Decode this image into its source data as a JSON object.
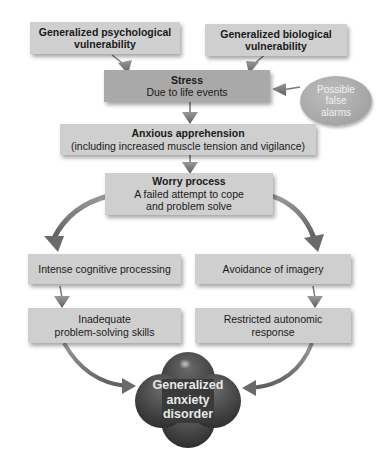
{
  "diagram": {
    "colors": {
      "box": "#cfcfcf",
      "box_dark": "#a9a9a9",
      "arrow": "#7a7a7a",
      "clover": "#3f3f3f",
      "oval": "#a8a8a8"
    },
    "nodes": {
      "psych_vuln": {
        "title": "Generalized psychological",
        "title2": "vulnerability"
      },
      "bio_vuln": {
        "title": "Generalized biological",
        "title2": "vulnerability"
      },
      "stress": {
        "title": "Stress",
        "subtitle": "Due to life events"
      },
      "false_alarms": {
        "line1": "Possible",
        "line2": "false",
        "line3": "alarms"
      },
      "anxious_apprehension": {
        "title": "Anxious apprehension",
        "subtitle": "(including increased muscle tension and vigilance)"
      },
      "worry": {
        "title": "Worry process",
        "line1": "A failed attempt to cope",
        "line2": "and problem solve"
      },
      "cognitive": {
        "label": "Intense cognitive processing"
      },
      "avoidance": {
        "label": "Avoidance of imagery"
      },
      "inadequate": {
        "line1": "Inadequate",
        "line2": "problem-solving skills"
      },
      "restricted": {
        "line1": "Restricted autonomic",
        "line2": "response"
      },
      "gad": {
        "line1": "Generalized",
        "line2": "anxiety",
        "line3": "disorder"
      }
    },
    "edges": [
      [
        "psych_vuln",
        "stress"
      ],
      [
        "bio_vuln",
        "stress"
      ],
      [
        "false_alarms",
        "stress"
      ],
      [
        "stress",
        "anxious_apprehension"
      ],
      [
        "anxious_apprehension",
        "worry"
      ],
      [
        "worry",
        "cognitive"
      ],
      [
        "worry",
        "avoidance"
      ],
      [
        "cognitive",
        "inadequate"
      ],
      [
        "avoidance",
        "restricted"
      ],
      [
        "inadequate",
        "gad"
      ],
      [
        "restricted",
        "gad"
      ]
    ]
  }
}
